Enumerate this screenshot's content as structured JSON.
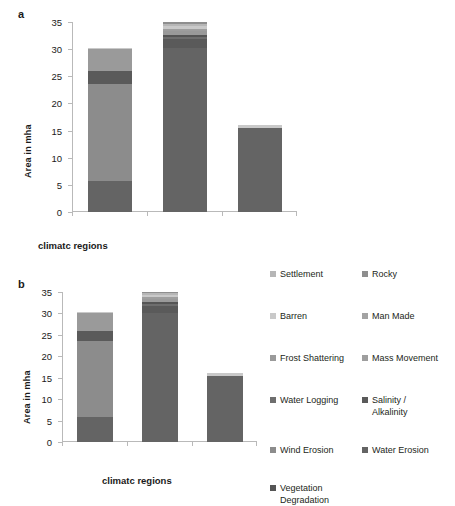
{
  "figure": {
    "panel_a_letter": "a",
    "panel_b_letter": "b"
  },
  "axis": {
    "ylabel": "Area in mha",
    "xlabel": "climatc regions",
    "yticks": [
      "0",
      "5",
      "10",
      "15",
      "20",
      "25",
      "30",
      "35"
    ]
  },
  "categories": [
    {
      "label": "Arid"
    },
    {
      "label": "Semi-\nArid"
    },
    {
      "label": "Sub-\nHumid"
    }
  ],
  "legend": {
    "left_column": [
      {
        "label": "Settlement",
        "color": "#b6b6b6"
      },
      {
        "label": "Barren",
        "color": "#c9c9c9"
      },
      {
        "label": "Frost Shattering",
        "color": "#9a9a9a"
      },
      {
        "label": "Water Logging",
        "color": "#6e6e6e"
      },
      {
        "label": "Wind Erosion",
        "color": "#8c8c8c"
      }
    ],
    "right_column": [
      {
        "label": "Rocky",
        "color": "#8e8e8e"
      },
      {
        "label": "Man Made",
        "color": "#a3a3a3"
      },
      {
        "label": "Mass Movement",
        "color": "#9e9e9e"
      },
      {
        "label": "Salinity /\nAlkalinity",
        "color": "#5a5a5a"
      },
      {
        "label": "Water Erosion",
        "color": "#646464"
      }
    ],
    "bottom": [
      {
        "label": "Vegetation\nDegradation",
        "color": "#555555"
      }
    ]
  },
  "chart_data": {
    "type": "bar",
    "stacked": true,
    "title": "",
    "xlabel": "climatc regions",
    "ylabel": "Area in mha",
    "ylim": [
      0,
      35
    ],
    "grid": false,
    "legend_position": "right",
    "categories": [
      "Arid",
      "Semi-Arid",
      "Sub-Humid"
    ],
    "series": [
      {
        "name": "Water Erosion",
        "color": "#646464",
        "values": [
          5.8,
          30.2,
          15.5
        ]
      },
      {
        "name": "Wind Erosion",
        "color": "#8c8c8c",
        "values": [
          17.7,
          0.0,
          0.0
        ]
      },
      {
        "name": "Salinity / Alkalinity",
        "color": "#5a5a5a",
        "values": [
          2.5,
          1.6,
          0.0
        ]
      },
      {
        "name": "Water Logging",
        "color": "#6e6e6e",
        "values": [
          0.0,
          0.5,
          0.0
        ]
      },
      {
        "name": "Vegetation Degradation",
        "color": "#555555",
        "values": [
          0.0,
          0.4,
          0.0
        ]
      },
      {
        "name": "Frost Shattering",
        "color": "#9a9a9a",
        "values": [
          4.0,
          0.6,
          0.0
        ]
      },
      {
        "name": "Mass Movement",
        "color": "#9e9e9e",
        "values": [
          0.0,
          0.5,
          0.0
        ]
      },
      {
        "name": "Barren",
        "color": "#c9c9c9",
        "values": [
          0.25,
          0.5,
          0.6
        ]
      },
      {
        "name": "Settlement",
        "color": "#b6b6b6",
        "values": [
          0.0,
          0.4,
          0.0
        ]
      },
      {
        "name": "Rocky",
        "color": "#8e8e8e",
        "values": [
          0.0,
          0.3,
          0.0
        ]
      }
    ],
    "totals": [
      30.25,
      35.0,
      16.1
    ],
    "panels": [
      "a",
      "b"
    ],
    "note": "Panels a and b show the same stacked bar chart; panel b is accompanied by the legend."
  }
}
